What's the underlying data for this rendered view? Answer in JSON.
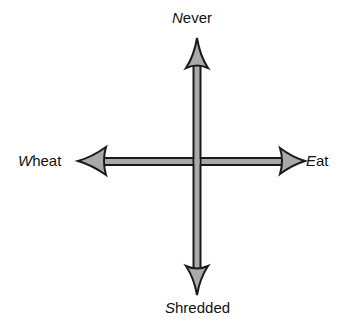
{
  "diagram": {
    "type": "quadrant-axes",
    "axes": {
      "vertical": {
        "top": {
          "initial": "N",
          "rest": "ever",
          "full": "Never"
        },
        "bottom": {
          "initial": "S",
          "rest": "hredded",
          "full": "Shredded"
        }
      },
      "horizontal": {
        "left": {
          "initial": "W",
          "rest": "heat",
          "full": "Wheat"
        },
        "right": {
          "initial": "E",
          "rest": "at",
          "full": "Eat"
        }
      }
    },
    "colors": {
      "arrow_fill": "#a9a9a9",
      "arrow_outline": "#1a1a1a",
      "background": "#ffffff",
      "text": "#111111"
    }
  }
}
